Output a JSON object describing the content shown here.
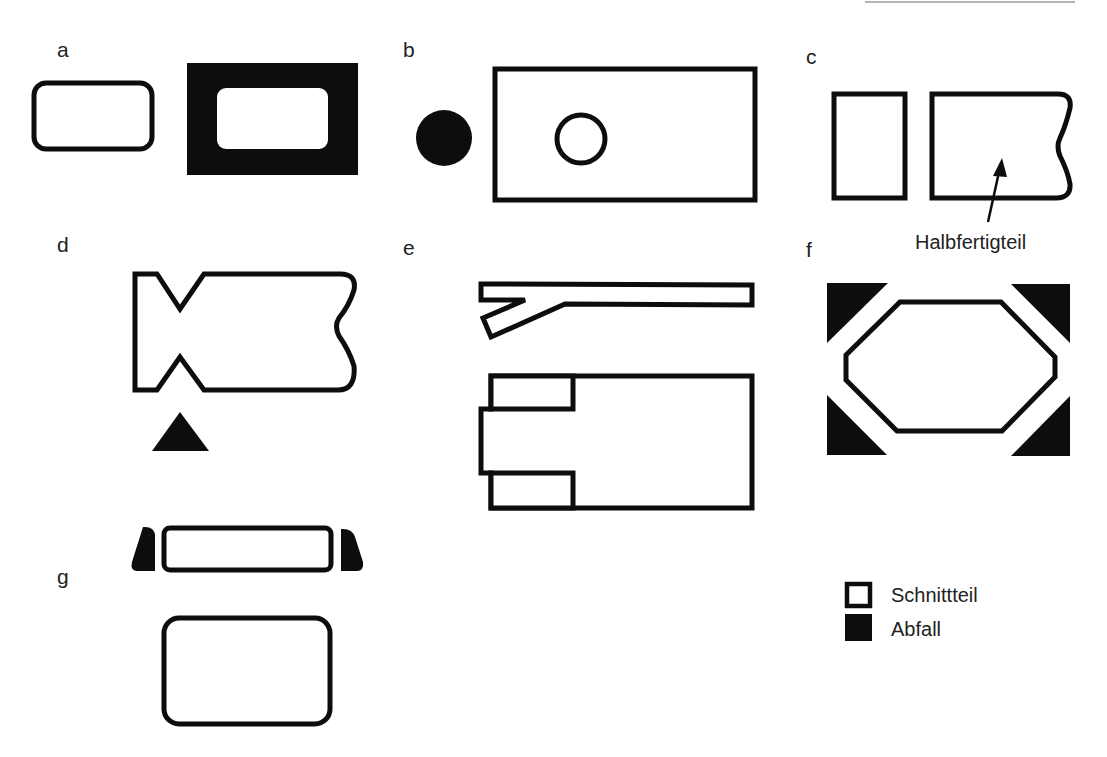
{
  "figure": {
    "panels": [
      {
        "id": "a",
        "label": "a"
      },
      {
        "id": "b",
        "label": "b"
      },
      {
        "id": "c",
        "label": "c",
        "annotation": "Halbfertigteil"
      },
      {
        "id": "d",
        "label": "d"
      },
      {
        "id": "e",
        "label": "e"
      },
      {
        "id": "f",
        "label": "f"
      },
      {
        "id": "g",
        "label": "g"
      }
    ],
    "legend": {
      "items": [
        {
          "label": "Schnittteil",
          "style": "outline"
        },
        {
          "label": "Abfall",
          "style": "filled"
        }
      ]
    },
    "colors": {
      "ink": "#0d0d0d",
      "background": "#ffffff"
    }
  }
}
